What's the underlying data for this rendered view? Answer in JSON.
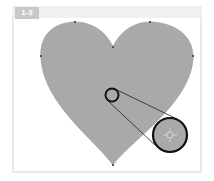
{
  "figure": {
    "label": "1-3",
    "colors": {
      "heart_fill": "#a9a9a9",
      "anchor": "#555555",
      "circle_stroke": "#111111",
      "frame": "#e9e9e9",
      "badge": "#c8c8c8"
    },
    "shape": "heart",
    "anchor_points": [
      {
        "x": 75,
        "y": 22
      },
      {
        "x": 150,
        "y": 22
      },
      {
        "x": 113,
        "y": 47
      },
      {
        "x": 41,
        "y": 56
      },
      {
        "x": 193,
        "y": 56
      },
      {
        "x": 113,
        "y": 165
      }
    ],
    "small_circle": {
      "cx": 112,
      "cy": 95,
      "r": 7
    },
    "magnified_circle": {
      "cx": 170,
      "cy": 135,
      "r": 17,
      "icon": "crosshair-anchor-icon"
    }
  }
}
